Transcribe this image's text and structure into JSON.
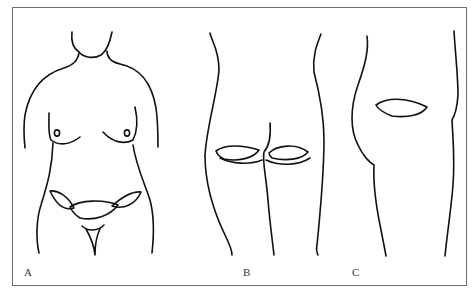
{
  "figure": {
    "colors": {
      "line": "#111111",
      "frame": "#6d6d6d",
      "background": "#ffffff",
      "label": "#333333"
    },
    "panels": [
      {
        "id": "A",
        "label": "A",
        "view": "anterior torso",
        "markings": [
          "bilateral lower abdominal/groin ellipses",
          "central lower abdominal ellipse"
        ]
      },
      {
        "id": "B",
        "label": "B",
        "view": "posterior buttocks",
        "markings": [
          "left gluteal fold ellipse",
          "right gluteal fold ellipse"
        ]
      },
      {
        "id": "C",
        "label": "C",
        "view": "lateral hip/flank",
        "markings": [
          "lateral hip ellipse"
        ]
      }
    ]
  }
}
